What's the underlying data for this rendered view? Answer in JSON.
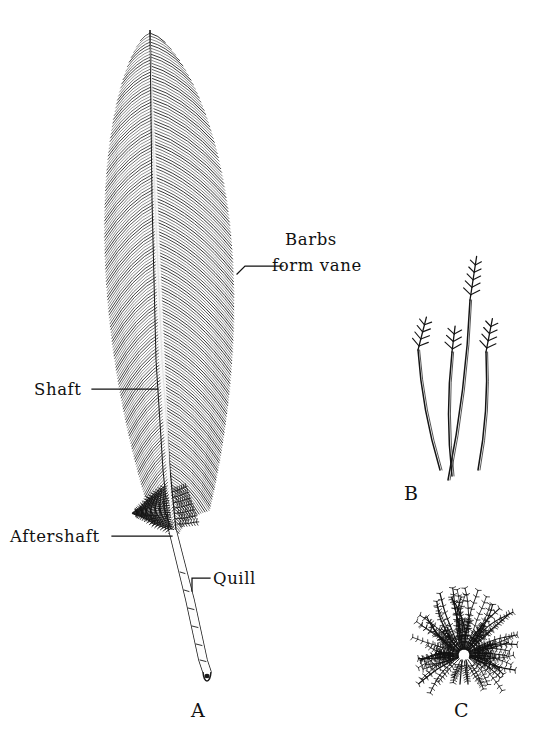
{
  "figure": {
    "background_color": "#ffffff",
    "ink_color": "#1a1a1a",
    "width": 552,
    "height": 737
  },
  "labels": {
    "barbs": "Barbs",
    "form_vane": "form vane",
    "shaft": "Shaft",
    "aftershaft": "Aftershaft",
    "quill": "Quill"
  },
  "panels": {
    "a": "A",
    "b": "B",
    "c": "C"
  },
  "panel_descriptions": {
    "a": "contour-feather",
    "b": "filoplumes",
    "c": "down-feather"
  }
}
